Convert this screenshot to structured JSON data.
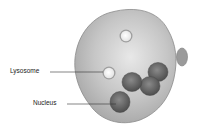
{
  "diagram": {
    "labels": [
      {
        "text": "Lysosome",
        "target": "lysosome"
      },
      {
        "text": "Nucleus",
        "target": "nucleus"
      }
    ],
    "colors": {
      "cytoplasm": "#bdbdbd",
      "cytoplasm_highlight": "#e6e6e6",
      "outline": "#8a8a8a",
      "nucleus": "#6e6e6e",
      "nucleus_dark": "#4a4a4a",
      "vesicle": "#f4f4f4",
      "leader_line": "#333333"
    }
  }
}
